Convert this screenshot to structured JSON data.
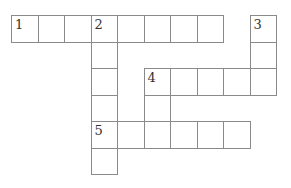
{
  "puzzle": {
    "type": "crossword",
    "cell_size": 26.5,
    "origin": {
      "x": 11,
      "y": 15
    },
    "cells": [
      {
        "r": 0,
        "c": 0,
        "num": "1"
      },
      {
        "r": 0,
        "c": 1
      },
      {
        "r": 0,
        "c": 2
      },
      {
        "r": 0,
        "c": 3,
        "num": "2"
      },
      {
        "r": 0,
        "c": 4
      },
      {
        "r": 0,
        "c": 5
      },
      {
        "r": 0,
        "c": 6
      },
      {
        "r": 0,
        "c": 7
      },
      {
        "r": 0,
        "c": 9,
        "num": "3"
      },
      {
        "r": 1,
        "c": 3
      },
      {
        "r": 1,
        "c": 9
      },
      {
        "r": 2,
        "c": 3
      },
      {
        "r": 2,
        "c": 5,
        "num": "4"
      },
      {
        "r": 2,
        "c": 6
      },
      {
        "r": 2,
        "c": 7
      },
      {
        "r": 2,
        "c": 8
      },
      {
        "r": 2,
        "c": 9
      },
      {
        "r": 3,
        "c": 3
      },
      {
        "r": 3,
        "c": 5
      },
      {
        "r": 4,
        "c": 3,
        "num": "5"
      },
      {
        "r": 4,
        "c": 4
      },
      {
        "r": 4,
        "c": 5
      },
      {
        "r": 4,
        "c": 6
      },
      {
        "r": 4,
        "c": 7
      },
      {
        "r": 4,
        "c": 8
      },
      {
        "r": 5,
        "c": 3
      }
    ],
    "entries": [
      {
        "number": "1",
        "direction": "across",
        "length": 8
      },
      {
        "number": "2",
        "direction": "down",
        "length": 6
      },
      {
        "number": "3",
        "direction": "down",
        "length": 3
      },
      {
        "number": "4",
        "direction": "across",
        "length": 5
      },
      {
        "number": "4",
        "direction": "down",
        "length": 3
      },
      {
        "number": "5",
        "direction": "across",
        "length": 6
      }
    ]
  }
}
